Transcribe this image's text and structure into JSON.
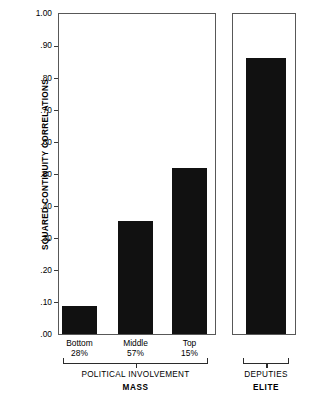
{
  "chart_data": {
    "type": "bar",
    "title": "",
    "xlabel": "",
    "ylabel": "SQUARED CONTINUITY CORRELATIONS",
    "ylim": [
      0.0,
      1.0
    ],
    "grid": false,
    "legend": "none",
    "y_ticks": [
      "1.00",
      ".90",
      ".80",
      ".70",
      ".60",
      ".50",
      ".40",
      ".30",
      ".20",
      ".10",
      ".00"
    ],
    "y_tick_values": [
      1.0,
      0.9,
      0.8,
      0.7,
      0.6,
      0.5,
      0.4,
      0.3,
      0.2,
      0.1,
      0.0
    ],
    "panels": [
      {
        "name": "mass-panel",
        "group_label": "POLITICAL INVOLVEMENT",
        "group_label_bold": "MASS",
        "categories": [
          "Bottom",
          "Middle",
          "Top"
        ],
        "category_sublabels": [
          "28%",
          "57%",
          "15%"
        ],
        "values": [
          0.09,
          0.355,
          0.52
        ]
      },
      {
        "name": "elite-panel",
        "group_label": "DEPUTIES",
        "group_label_bold": "ELITE",
        "categories": [
          "Deputies"
        ],
        "category_sublabels": [
          ""
        ],
        "values": [
          0.86
        ]
      }
    ],
    "bar_color": "#111111",
    "axis_color": "#585858"
  }
}
